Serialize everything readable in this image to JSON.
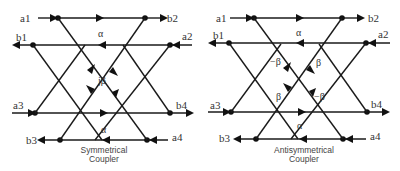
{
  "diagrams": [
    {
      "caption_line1": "Symmetrical",
      "caption_line2": "Coupler",
      "ports": {
        "a1": "a1",
        "b1": "b1",
        "a2": "a2",
        "b2": "b2",
        "a3": "a3",
        "b3": "b3",
        "a4": "a4",
        "b4": "b4"
      },
      "through_top": "α",
      "through_bottom": "α",
      "coupling": [
        "jβ"
      ]
    },
    {
      "caption_line1": "Antisymmetrical",
      "caption_line2": "Coupler",
      "ports": {
        "a1": "a1",
        "b1": "b1",
        "a2": "a2",
        "b2": "b2",
        "a3": "a3",
        "b3": "b3",
        "a4": "a4",
        "b4": "b4"
      },
      "through_top": "α",
      "through_bottom": "α",
      "coupling": [
        "−β",
        "β",
        "β",
        "−β"
      ]
    }
  ]
}
